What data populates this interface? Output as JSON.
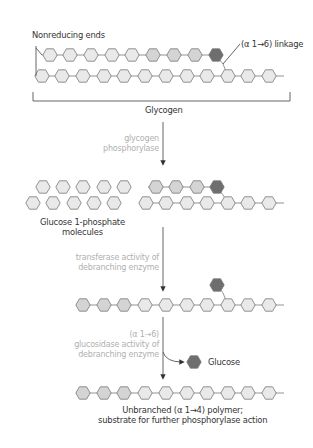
{
  "labels": {
    "nonreducing_ends": "Nonreducing ends",
    "linkage": "(α 1→6) linkage",
    "glycogen": "Glycogen",
    "glucose1p_line1": "Glucose 1-phosphate",
    "glucose1p_line2": "molecules",
    "glucose": "Glucose",
    "product_line1": "Unbranched (α 1→4) polymer;",
    "product_line2": "substrate for further phosphorylase action"
  },
  "enzymes": {
    "step1_line1": "glycogen",
    "step1_line2": "phosphorylase",
    "step2_line1": "transferase activity of",
    "step2_line2": "debranching enzyme",
    "step3_line1": "(α 1→6)",
    "step3_line2": "glucosidase activity of",
    "step3_line3": "debranching enzyme"
  },
  "colors": {
    "residue_light": "#e9e9e9",
    "residue_medium": "#d4d4d4",
    "residue_branch_point": "#6e6e6e",
    "outline": "#777777",
    "enzyme_text": "#b0b0b0",
    "label_text": "#333333"
  }
}
